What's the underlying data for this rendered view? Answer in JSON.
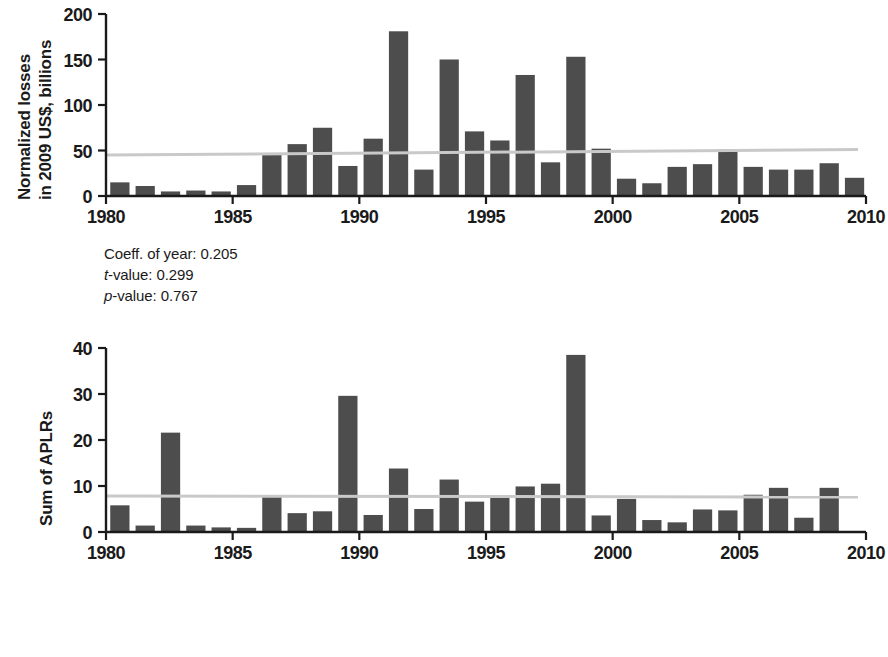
{
  "figure": {
    "background": "#ffffff",
    "bar_color": "#4d4d4d",
    "axis_color": "#1a1a1a",
    "trend_color": "#c9c9c9"
  },
  "panels": [
    {
      "id": "top",
      "ylabel_lines": [
        "Normalized losses",
        "in 2009 US$, billions"
      ],
      "stats": [
        {
          "prefix": "",
          "italic": "",
          "label": "Coeff. of year: ",
          "value": "0.205"
        },
        {
          "prefix": "",
          "italic": "t",
          "label": "-value: ",
          "value": "0.299"
        },
        {
          "prefix": "",
          "italic": "p",
          "label": "-value: ",
          "value": "0.767"
        }
      ],
      "chart_data": {
        "type": "bar",
        "title": "",
        "xlabel": "",
        "ylabel": "Normalized losses in 2009 US$, billions",
        "xlim": [
          1980,
          2010
        ],
        "ylim": [
          0,
          200
        ],
        "xticks": [
          1980,
          1985,
          1990,
          1995,
          2000,
          2005,
          2010
        ],
        "yticks": [
          0,
          50,
          100,
          150,
          200
        ],
        "grid": false,
        "legend": "none",
        "categories": [
          1980,
          1981,
          1982,
          1983,
          1984,
          1985,
          1986,
          1987,
          1988,
          1989,
          1990,
          1991,
          1992,
          1993,
          1994,
          1995,
          1996,
          1997,
          1998,
          1999,
          2000,
          2001,
          2002,
          2003,
          2004,
          2005,
          2006,
          2007,
          2008,
          2009
        ],
        "values": [
          15,
          11,
          5,
          6,
          5,
          12,
          45,
          57,
          75,
          33,
          63,
          181,
          29,
          150,
          71,
          61,
          133,
          37,
          153,
          52,
          19,
          14,
          32,
          35,
          51,
          32,
          29,
          29,
          36,
          20
        ],
        "annotations": [
          {
            "text": "Coeff. of year: 0.205"
          },
          {
            "text": "t-value: 0.299"
          },
          {
            "text": "p-value: 0.767"
          }
        ],
        "trendline": {
          "type": "linear",
          "y_at_xmin": 45,
          "y_at_xmax": 51,
          "color": "#c9c9c9"
        }
      }
    },
    {
      "id": "bot",
      "ylabel_lines": [
        "Sum of APLRs"
      ],
      "stats": [
        {
          "prefix": "",
          "italic": "",
          "label": "Coeff. of year: ",
          "value": "−0.005"
        },
        {
          "prefix": "",
          "italic": "t",
          "label": "-value: ",
          "value": "−0.033"
        },
        {
          "prefix": "",
          "italic": "p",
          "label": "-value: ",
          "value": "0.974"
        }
      ],
      "chart_data": {
        "type": "bar",
        "title": "",
        "xlabel": "",
        "ylabel": "Sum of APLRs",
        "xlim": [
          1980,
          2010
        ],
        "ylim": [
          0,
          40
        ],
        "xticks": [
          1980,
          1985,
          1990,
          1995,
          2000,
          2005,
          2010
        ],
        "yticks": [
          0,
          10,
          20,
          30,
          40
        ],
        "grid": false,
        "legend": "none",
        "categories": [
          1980,
          1981,
          1982,
          1983,
          1984,
          1985,
          1986,
          1987,
          1988,
          1989,
          1990,
          1991,
          1992,
          1993,
          1994,
          1995,
          1996,
          1997,
          1998,
          1999,
          2000,
          2001,
          2002,
          2003,
          2004,
          2005,
          2006,
          2007,
          2008,
          2009
        ],
        "values": [
          5.8,
          1.4,
          21.6,
          1.4,
          1.0,
          0.9,
          7.9,
          4.1,
          4.5,
          29.6,
          3.7,
          13.8,
          5.0,
          11.4,
          6.6,
          7.8,
          9.9,
          10.5,
          38.5,
          3.6,
          7.2,
          2.6,
          2.1,
          4.9,
          4.7,
          8.1,
          9.6,
          3.1,
          9.6,
          0
        ],
        "annotations": [
          {
            "text": "Coeff. of year: −0.005"
          },
          {
            "text": "t-value: −0.033"
          },
          {
            "text": "p-value: 0.974"
          }
        ],
        "trendline": {
          "type": "linear",
          "y_at_xmin": 7.8,
          "y_at_xmax": 7.6,
          "color": "#c9c9c9"
        }
      }
    }
  ]
}
